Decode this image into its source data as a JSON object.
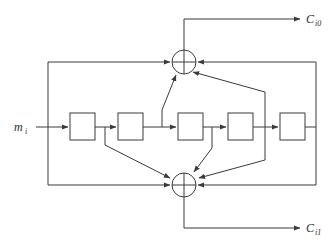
{
  "figure": {
    "background_color": "#ffffff",
    "line_color": "#3a3a3a"
  },
  "input": {
    "label_base": "m",
    "label_sub": "i",
    "full_label": "m_i",
    "name": "message-input"
  },
  "outputs": [
    {
      "label_base": "C",
      "label_sub": "i0",
      "full_label": "C_i0",
      "name": "output-ci0",
      "position": "top-right"
    },
    {
      "label_base": "C",
      "label_sub": "i1",
      "full_label": "C_i1",
      "name": "output-ci1",
      "position": "bottom-right"
    }
  ],
  "shift_registers": [
    {
      "index": 1,
      "label": "",
      "name": "shift-register-1"
    },
    {
      "index": 2,
      "label": "",
      "name": "shift-register-2"
    },
    {
      "index": 3,
      "label": "",
      "name": "shift-register-3"
    },
    {
      "index": 4,
      "label": "",
      "name": "shift-register-4"
    },
    {
      "index": 5,
      "label": "",
      "name": "shift-register-5"
    }
  ],
  "adders": [
    {
      "index": 0,
      "symbol": "XOR",
      "name": "modulo-2-adder-top",
      "output": "C_i0"
    },
    {
      "index": 1,
      "symbol": "XOR",
      "name": "modulo-2-adder-bottom",
      "output": "C_i1"
    }
  ],
  "connections": {
    "top_adder_taps": [
      "input-bus-left",
      "tap-after-register-2",
      "tap-after-register-4",
      "feedback-right-bus"
    ],
    "bottom_adder_taps": [
      "input-bus-left",
      "tap-after-register-1",
      "tap-after-register-3",
      "tap-after-register-4",
      "feedback-right-bus"
    ]
  }
}
